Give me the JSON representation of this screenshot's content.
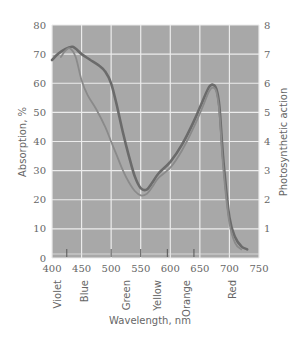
{
  "chart_data": {
    "type": "line",
    "title": "",
    "xlabel": "Wavelength, nm",
    "ylabel_left": "Absorption, %",
    "ylabel_right": "Photosynthetic action",
    "xlim": [
      400,
      750
    ],
    "ylim_left": [
      0,
      80
    ],
    "ylim_right": [
      0,
      8
    ],
    "x_ticks": [
      "400",
      "450",
      "500",
      "550",
      "600",
      "650",
      "700",
      "750"
    ],
    "y_ticks_left": [
      "0",
      "10",
      "20",
      "30",
      "40",
      "50",
      "60",
      "70",
      "80"
    ],
    "y_ticks_right": [
      "1",
      "2",
      "3",
      "4",
      "5",
      "6",
      "7",
      "8"
    ],
    "grid": true,
    "legend": null,
    "color_bands": [
      {
        "label": "Violet",
        "x": 420
      },
      {
        "label": "Blue",
        "x": 450
      },
      {
        "label": "Green",
        "x": 525
      },
      {
        "label": "Yellow",
        "x": 575
      },
      {
        "label": "Orange",
        "x": 620
      },
      {
        "label": "Red",
        "x": 700
      }
    ],
    "band_boundary_ticks": [
      425,
      500,
      550,
      595,
      640
    ],
    "series": [
      {
        "name": "Absorption",
        "axis": "left",
        "color": "#6b6b6b",
        "x": [
          400,
          410,
          420,
          435,
          450,
          465,
          480,
          490,
          500,
          510,
          520,
          530,
          540,
          550,
          560,
          570,
          580,
          600,
          620,
          640,
          655,
          665,
          672,
          678,
          683,
          690,
          700,
          710,
          720,
          730
        ],
        "y": [
          68,
          70,
          71.5,
          72.5,
          70,
          68,
          66,
          64,
          60,
          52,
          43,
          35,
          28,
          24,
          23.5,
          26,
          29,
          33,
          39,
          47,
          54,
          58.5,
          59.5,
          58,
          52,
          33,
          14,
          7,
          4,
          3
        ]
      },
      {
        "name": "Photosynthetic action",
        "axis": "right",
        "color": "#8a8a8a",
        "x": [
          415,
          422,
          430,
          440,
          450,
          460,
          475,
          490,
          500,
          510,
          520,
          530,
          540,
          550,
          560,
          570,
          580,
          600,
          620,
          640,
          655,
          665,
          672,
          678,
          683,
          690,
          700,
          710,
          720
        ],
        "y": [
          6.9,
          7.1,
          7.2,
          6.9,
          6.1,
          5.6,
          5.1,
          4.5,
          4.0,
          3.5,
          3.0,
          2.6,
          2.3,
          2.15,
          2.2,
          2.45,
          2.75,
          3.1,
          3.7,
          4.5,
          5.2,
          5.7,
          5.85,
          5.7,
          5.0,
          3.0,
          1.2,
          0.5,
          0.3
        ]
      }
    ]
  }
}
